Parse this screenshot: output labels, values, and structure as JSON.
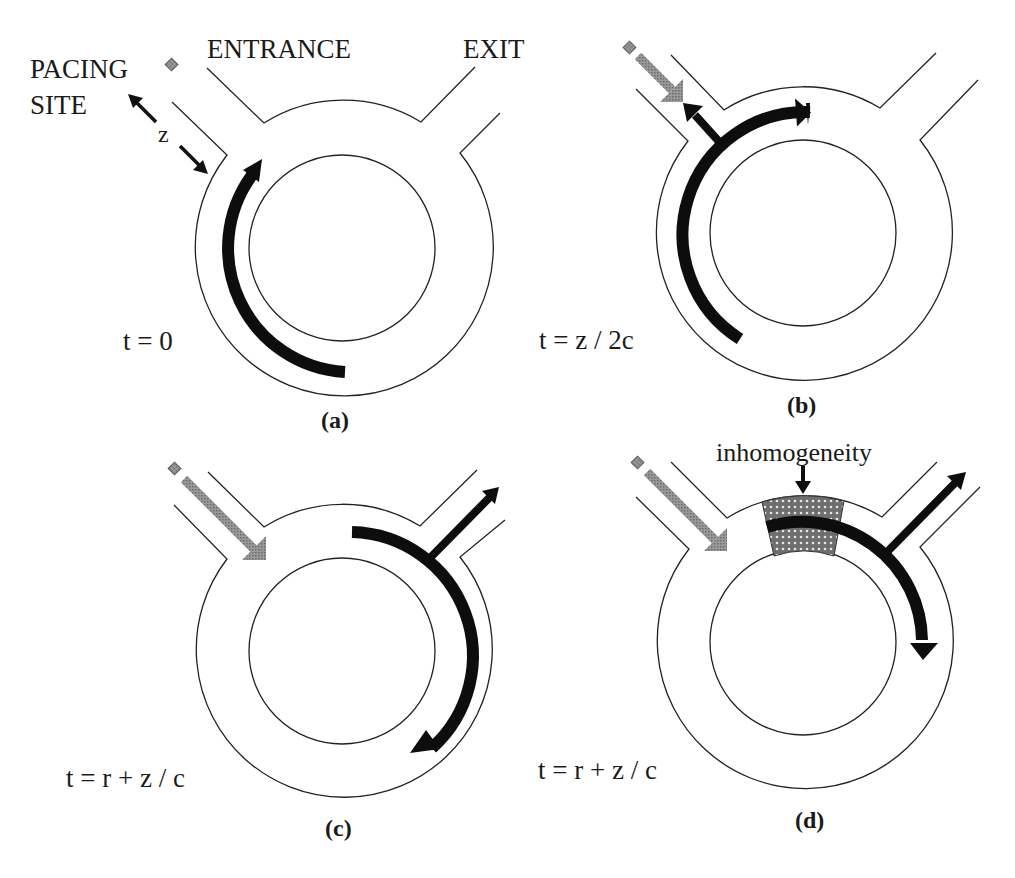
{
  "figure": {
    "colors": {
      "line": "#222222",
      "wave": "#0d0d0d",
      "stimulus": "#8c8c8c",
      "pacing_site": "#8a8a8a",
      "inhomogeneity": "#7a7a7a"
    },
    "labels": {
      "pacing_site_line1": "PACING",
      "pacing_site_line2": "SITE",
      "entrance": "ENTRANCE",
      "exit": "EXIT",
      "distance": "z",
      "inhomogeneity": "inhomogeneity"
    },
    "panels": [
      {
        "id": "a",
        "caption": "(a)",
        "time": "t = 0"
      },
      {
        "id": "b",
        "caption": "(b)",
        "time": "t = z / 2c"
      },
      {
        "id": "c",
        "caption": "(c)",
        "time": "t = r + z / c"
      },
      {
        "id": "d",
        "caption": "(d)",
        "time": "t = r + z / c"
      }
    ]
  }
}
